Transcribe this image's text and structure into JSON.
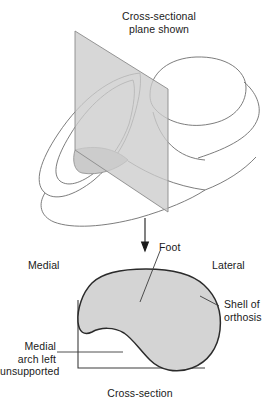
{
  "figure": {
    "caption": "Cross-section",
    "top_title": "Cross-sectional\nplane shown"
  },
  "labels": {
    "cross_sectional_plane": "Cross-sectional\nplane shown",
    "medial": "Medial",
    "lateral": "Lateral",
    "foot": "Foot",
    "shell_of_orthosis": "Shell of\northosis",
    "medial_arch": "Medial\narch left\nunsupported",
    "cross_section": "Cross-section"
  },
  "colors": {
    "background": "#ffffff",
    "stroke": "#3c3c3c",
    "stroke_light": "#808080",
    "plane_fill": "#cccccc",
    "section_fill": "#d4d4d4",
    "section_stroke": "#2b2b2b",
    "text": "#1a1a1a"
  },
  "geometry": {
    "plane_points": "75,31 168,89 168,212 75,150",
    "arrow_x": 145,
    "arrow_y_start": 218,
    "arrow_y_end": 250
  }
}
